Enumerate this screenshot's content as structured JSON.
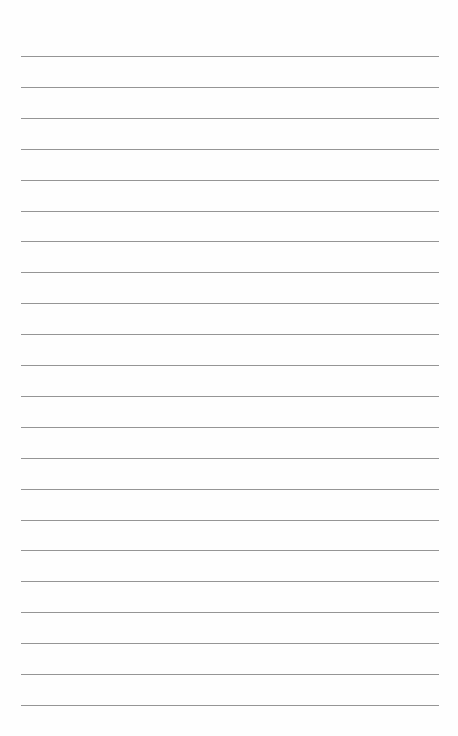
{
  "page": {
    "type": "lined-paper",
    "background_color": "#fefefe",
    "rule_color": "#8a8a8a",
    "rule_count": 22,
    "first_rule_y": 56,
    "rule_spacing": 30.9,
    "rule_left": 21,
    "rule_width": 418
  }
}
